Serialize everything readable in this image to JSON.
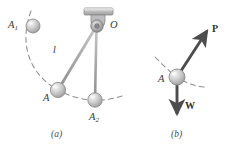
{
  "figure": {
    "type": "physics-diagram",
    "background_color": "#ffffff",
    "ink_color": "#8a8a8a",
    "label_color": "#3a3a3a",
    "vector_color": "#4d4d4d",
    "panels": [
      {
        "id": "a",
        "caption": "(a)",
        "description": "Pendulum pivoted at O swinging through positions A1, A, A2",
        "pivot": {
          "name": "O",
          "label": "O",
          "x": 97,
          "y": 26
        },
        "support": {
          "name": "ceiling-bracket",
          "x": 84,
          "y": 8,
          "width": 28,
          "height": 7
        },
        "rods": [
          {
            "name": "rod-O-A1",
            "from": "O",
            "to": "A1",
            "label": ""
          },
          {
            "name": "rod-O-A",
            "from": "O",
            "to": "A",
            "label": "l"
          },
          {
            "name": "rod-O-A2",
            "from": "O",
            "to": "A2",
            "label": ""
          }
        ],
        "bobs": [
          {
            "name": "A1",
            "label": "A",
            "sub": "1",
            "x": 33,
            "y": 26,
            "r": 7
          },
          {
            "name": "A",
            "label": "A",
            "sub": "",
            "x": 58,
            "y": 90,
            "r": 7.5
          },
          {
            "name": "A2",
            "label": "A",
            "sub": "2",
            "x": 95,
            "y": 100,
            "r": 7
          }
        ],
        "arc": {
          "name": "swing-path",
          "style": "dashed",
          "description": "arc of motion through A1, A, A2"
        },
        "length_label": "l"
      },
      {
        "id": "b",
        "caption": "(b)",
        "description": "Free body diagram of bob A with forces P and W",
        "bob": {
          "name": "A",
          "label": "A",
          "x": 177,
          "y": 77,
          "r": 8
        },
        "arc": {
          "name": "swing-path",
          "style": "dashed"
        },
        "vectors": [
          {
            "name": "force-P",
            "label": "P",
            "direction": "up-right",
            "tip_x": 209,
            "tip_y": 29
          },
          {
            "name": "force-W",
            "label": "W",
            "direction": "down",
            "tip_x": 177,
            "tip_y": 119
          }
        ]
      }
    ]
  }
}
